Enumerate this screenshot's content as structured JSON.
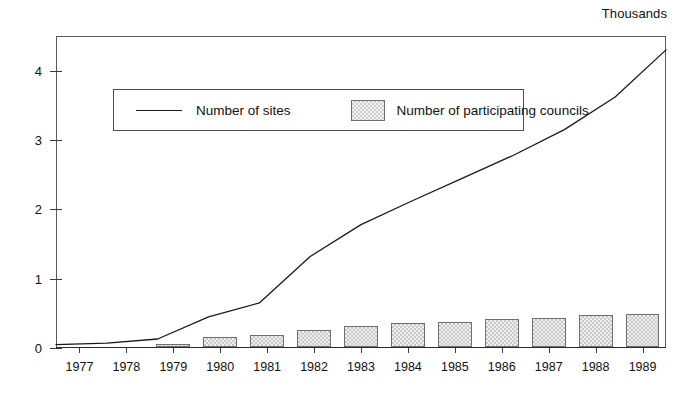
{
  "chart_data": {
    "type": "bar",
    "title": "",
    "subtitle": "",
    "unit_label": "Thousands",
    "xlabel": "",
    "ylabel": "",
    "ylim": [
      0,
      4.5
    ],
    "yticks": [
      0,
      1,
      2,
      3,
      4
    ],
    "ytick_labels": [
      "0",
      "1",
      "2",
      "3",
      "4"
    ],
    "grid": false,
    "legend_position": "upper-left-inside",
    "categories": [
      "1977",
      "1978",
      "1979",
      "1980",
      "1981",
      "1982",
      "1983",
      "1984",
      "1985",
      "1986",
      "1987",
      "1988",
      "1989"
    ],
    "series": [
      {
        "name": "Number of sites",
        "type": "line",
        "values": [
          0.05,
          0.07,
          0.13,
          0.45,
          0.65,
          1.32,
          1.78,
          2.12,
          2.45,
          2.78,
          3.15,
          3.62,
          4.3
        ]
      },
      {
        "name": "Number of participating councils",
        "type": "bar",
        "values": [
          0.0,
          0.0,
          0.05,
          0.15,
          0.18,
          0.25,
          0.3,
          0.35,
          0.36,
          0.41,
          0.42,
          0.46,
          0.48
        ]
      }
    ]
  },
  "legend": {
    "line_label": "Number of sites",
    "bar_label": "Number of participating councils"
  },
  "colors": {
    "line": "#1a1a1a",
    "bar_fill": "#efefef",
    "bar_border": "#6e6e6e",
    "axis": "#3a3a3a",
    "text": "#111111"
  }
}
